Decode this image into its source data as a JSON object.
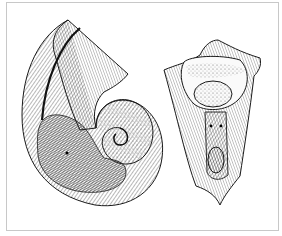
{
  "figure": {
    "frame_color": "#c8c8c8",
    "ink_color": "#1a1a1a",
    "background": "#ffffff",
    "panels": [
      {
        "name": "coiled-shell-side-view"
      },
      {
        "name": "shell-apertural-view"
      }
    ]
  }
}
